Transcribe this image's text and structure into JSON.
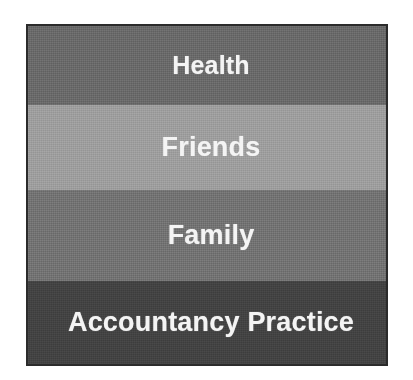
{
  "diagram": {
    "type": "stacked-bands",
    "title": "",
    "bands": [
      {
        "label": "Health",
        "color": "#6a6a6a",
        "order": 1
      },
      {
        "label": "Friends",
        "color": "#9e9e9e",
        "order": 2
      },
      {
        "label": "Family",
        "color": "#737373",
        "order": 3
      },
      {
        "label": "Accountancy Practice",
        "color": "#434343",
        "order": 4
      }
    ],
    "label_color": "#f4f4f4",
    "border_color": "#2b2b2b",
    "background_color": "#ffffff"
  }
}
